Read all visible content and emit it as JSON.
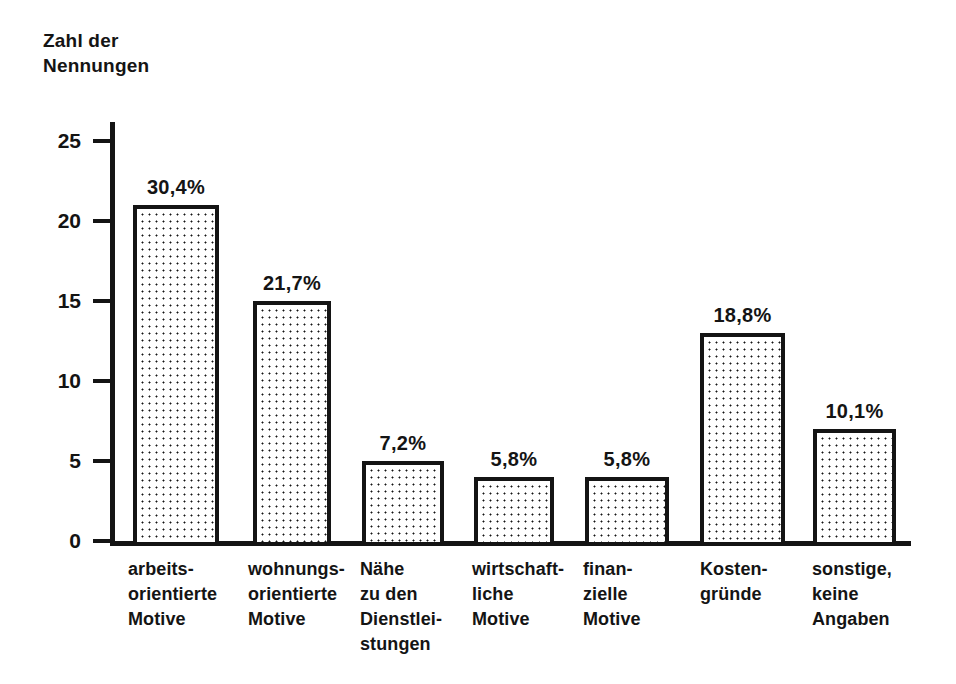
{
  "chart_data": {
    "type": "bar",
    "title": "Zahl der\nNennungen",
    "xlabel": "",
    "ylabel": "Zahl der Nennungen",
    "ylim": [
      0,
      25
    ],
    "yticks": [
      0,
      5,
      10,
      15,
      20,
      25
    ],
    "grid": false,
    "legend": "none",
    "categories": [
      "arbeits-\norientierte\nMotive",
      "wohnungs-\norientierte\nMotive",
      "Nähe\nzu den\nDienstlei-\nstungen",
      "wirtschaft-\nliche\nMotive",
      "finan-\nzielle\nMotive",
      "Kosten-\ngründe",
      "sonstige,\nkeine\nAngaben"
    ],
    "values": [
      21,
      15,
      5,
      4,
      4,
      13,
      7
    ],
    "data_labels": [
      "30,4%",
      "21,7%",
      "7,2%",
      "5,8%",
      "5,8%",
      "18,8%",
      "10,1%"
    ],
    "bar_fill": "dotted-stipple",
    "bar_edge_color": "#141414",
    "bar_face_color": "#ffffff",
    "axis_color": "#141414"
  },
  "axis": {
    "title": "Zahl der\nNennungen",
    "tick_labels": [
      "25",
      "20",
      "15",
      "10",
      "5",
      "0"
    ]
  },
  "bars": [
    {
      "label": "arbeits-\norientierte\nMotive",
      "value": 21,
      "percent": "30,4%"
    },
    {
      "label": "wohnungs-\norientierte\nMotive",
      "value": 15,
      "percent": "21,7%"
    },
    {
      "label": "Nähe\nzu den\nDienstlei-\nstungen",
      "value": 5,
      "percent": "7,2%"
    },
    {
      "label": "wirtschaft-\nliche\nMotive",
      "value": 4,
      "percent": "5,8%"
    },
    {
      "label": "finan-\nzielle\nMotive",
      "value": 4,
      "percent": "5,8%"
    },
    {
      "label": "Kosten-\ngründe",
      "value": 13,
      "percent": "18,8%"
    },
    {
      "label": "sonstige,\nkeine\nAngaben",
      "value": 7,
      "percent": "10,1%"
    }
  ]
}
